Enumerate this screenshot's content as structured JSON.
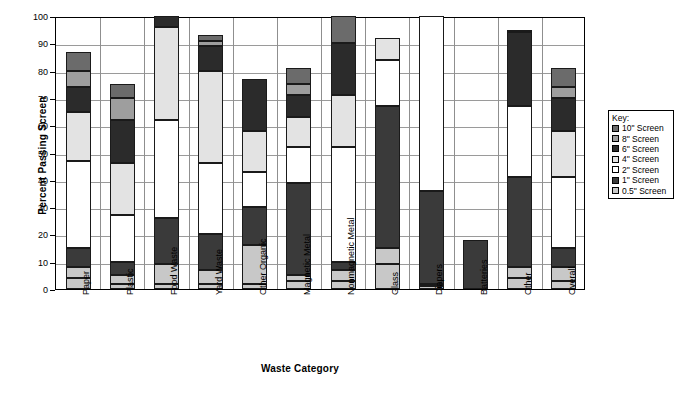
{
  "chart_data": {
    "type": "bar",
    "stacked": true,
    "title": "",
    "xlabel": "Waste Category",
    "ylabel": "Percent Passing Screen",
    "ylim": [
      0,
      100
    ],
    "yticks": [
      0,
      10,
      20,
      30,
      40,
      50,
      60,
      70,
      80,
      90,
      100
    ],
    "grid": true,
    "legend_position": "right",
    "legend_title": "Key:",
    "categories": [
      "Paper",
      "Plastic",
      "Food Waste",
      "Yard Waste",
      "Other Organic",
      "Magnetic Metal",
      "Nonmagnetic Metal",
      "Glass",
      "Diapers",
      "Batteries",
      "Other",
      "Overall"
    ],
    "series": [
      {
        "name": "10\" Screen",
        "color": "#6b6b6b",
        "values": [
          87,
          75,
          100,
          93,
          77,
          81,
          100,
          92,
          100,
          18,
          95,
          81
        ]
      },
      {
        "name": "8\" Screen",
        "color": "#9e9e9e",
        "values": [
          80,
          70,
          100,
          91,
          77,
          75,
          90,
          92,
          100,
          18,
          95,
          74
        ]
      },
      {
        "name": "6\" Screen",
        "color": "#2b2b2b",
        "values": [
          74,
          62,
          100,
          89,
          77,
          71,
          90,
          92,
          100,
          18,
          94,
          70
        ]
      },
      {
        "name": "4\" Screen",
        "color": "#e3e3e3",
        "values": [
          65,
          46,
          96,
          80,
          58,
          63,
          71,
          92,
          100,
          18,
          67,
          58
        ]
      },
      {
        "name": "2\" Screen",
        "color": "#ffffff",
        "values": [
          47,
          27,
          62,
          46,
          43,
          52,
          52,
          84,
          100,
          18,
          67,
          41
        ]
      },
      {
        "name": "1\" Screen",
        "color": "#3a3a3a",
        "values": [
          15,
          10,
          26,
          20,
          30,
          39,
          10,
          67,
          36,
          18,
          41,
          15
        ]
      },
      {
        "name": "0.5\" Screen",
        "color": "#c8c8c8",
        "values": [
          8,
          5,
          9,
          7,
          16,
          5,
          7,
          15,
          2,
          0,
          8,
          8
        ]
      }
    ],
    "base_values": [
      4,
      2,
      2,
      2,
      2,
      3,
      3,
      9,
      1,
      0,
      4,
      3
    ]
  },
  "legend": {
    "title": "Key:",
    "items": [
      {
        "label": "10\" Screen"
      },
      {
        "label": "8\" Screen"
      },
      {
        "label": "6\" Screen"
      },
      {
        "label": "4\" Screen"
      },
      {
        "label": "2\" Screen"
      },
      {
        "label": "1\" Screen"
      },
      {
        "label": "0.5\" Screen"
      }
    ]
  }
}
